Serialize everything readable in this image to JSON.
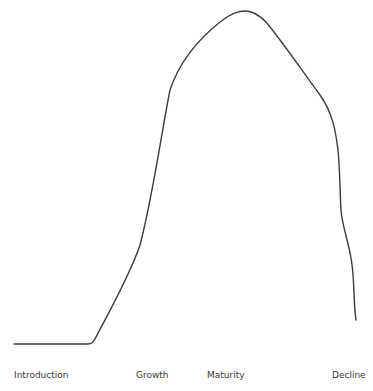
{
  "diagram": {
    "curve_color": "#3c3c3c",
    "background": "#ffffff",
    "stages": [
      {
        "label": "Introduction",
        "x": 14
      },
      {
        "label": "Growth",
        "x": 136
      },
      {
        "label": "Maturity",
        "x": 207
      },
      {
        "label": "Decline",
        "x": 332
      }
    ],
    "curve_path": "M14,344 L88,344 C92,344 93,342 95,339 C110,310 130,275 140,245 C152,200 162,130 170,90 C180,60 200,38 220,22 C232,13 238,11 246,11 C254,11 260,16 266,22 C285,45 305,75 320,95 C334,115 336,135 338,150 C340,170 340,195 341,210 C342,225 348,240 351,258 C355,280 353,300 356,320"
  }
}
